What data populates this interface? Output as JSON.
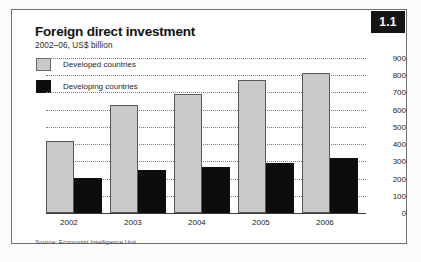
{
  "figure": {
    "badge": "1.1",
    "title": "Foreign direct investment",
    "subtitle": "2002–06, US$ billion",
    "source": "Source: Economist Intelligence Unit",
    "colors": {
      "developed": "#c9c9c9",
      "developing": "#0d0d0d",
      "badge_background": "#141414",
      "badge_text": "#ffffff",
      "gridline": "#7d7d7d",
      "axis": "#3a3a3a"
    }
  },
  "legend": {
    "position": "top-left",
    "items": [
      {
        "label": "Developed countries",
        "swatch": "light-gray-square"
      },
      {
        "label": "Developing countries",
        "swatch": "black-square"
      }
    ]
  },
  "chart_data": {
    "type": "bar",
    "title": "Foreign direct investment",
    "subtitle": "2002–06, US$ billion",
    "xlabel": "",
    "ylabel": "US$ billion",
    "categories": [
      "2002",
      "2003",
      "2004",
      "2005",
      "2006"
    ],
    "series": [
      {
        "name": "Developed countries",
        "values": [
          420,
          630,
          690,
          775,
          815
        ]
      },
      {
        "name": "Developing countries",
        "values": [
          205,
          250,
          268,
          288,
          320
        ]
      }
    ],
    "ylim": [
      0,
      900
    ],
    "yticks": [
      0,
      100,
      200,
      300,
      400,
      500,
      600,
      700,
      800,
      900
    ],
    "ytick_labels": [
      "0",
      "100",
      "200",
      "300",
      "400",
      "500",
      "600",
      "700",
      "800",
      "900"
    ],
    "grid": true,
    "grid_style": "dotted-horizontal",
    "y_axis_side": "right",
    "legend_position": "top-left"
  }
}
